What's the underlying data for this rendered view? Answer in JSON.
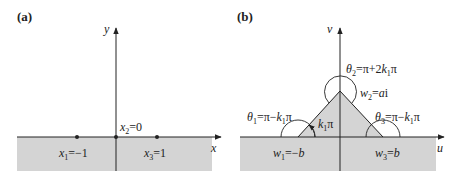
{
  "panels": [
    {
      "id": "a",
      "label": "(a)",
      "x_axis_label": "x",
      "y_axis_label": "y",
      "points": [
        {
          "name": "x1",
          "sym": "x",
          "sub": "1",
          "eq": "=−1"
        },
        {
          "name": "x2",
          "sym": "x",
          "sub": "2",
          "eq": "=0"
        },
        {
          "name": "x3",
          "sym": "x",
          "sub": "3",
          "eq": "=1"
        }
      ]
    },
    {
      "id": "b",
      "label": "(b)",
      "x_axis_label": "u",
      "y_axis_label": "v",
      "angle_label": {
        "k": "k",
        "sub": "1",
        "rest": "π"
      },
      "vertices": [
        {
          "name": "w1",
          "sym": "w",
          "sub": "1",
          "eq": "=−",
          "val": "b"
        },
        {
          "name": "w2",
          "sym": "w",
          "sub": "2",
          "eq": "=",
          "val": "a",
          "suffix": "i"
        },
        {
          "name": "w3",
          "sym": "w",
          "sub": "3",
          "eq": "=",
          "val": "b"
        }
      ],
      "angles": [
        {
          "name": "theta1",
          "sym": "θ",
          "sub": "1",
          "eq": "=π−",
          "k": "k",
          "ksub": "1",
          "tail": "π"
        },
        {
          "name": "theta2",
          "sym": "θ",
          "sub": "2",
          "eq": "=π+2",
          "k": "k",
          "ksub": "1",
          "tail": "π"
        },
        {
          "name": "theta3",
          "sym": "θ",
          "sub": "3",
          "eq": "=π−",
          "k": "k",
          "ksub": "1",
          "tail": "π"
        }
      ]
    }
  ],
  "colors": {
    "shade": "#d4d4d4",
    "line": "#222222"
  }
}
